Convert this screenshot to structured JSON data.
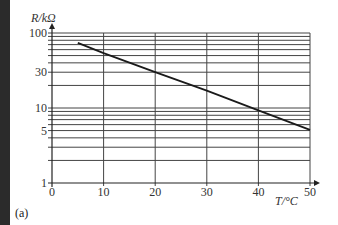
{
  "chart_data": {
    "type": "line",
    "title": "",
    "panel_label": "(a)",
    "xlabel": "T/°C",
    "ylabel": "R/kΩ",
    "yscale": "log",
    "xlim": [
      0,
      50
    ],
    "ylim": [
      1,
      100
    ],
    "x_ticks": [
      0,
      10,
      20,
      30,
      40,
      50
    ],
    "x_tick_labels": [
      "0",
      "10",
      "20",
      "30",
      "40",
      "50"
    ],
    "y_tick_labels": [
      {
        "value": 100,
        "label": "100"
      },
      {
        "value": 30,
        "label": "30"
      },
      {
        "value": 10,
        "label": "10"
      },
      {
        "value": 5,
        "label": "5"
      },
      {
        "value": 1,
        "label": "1"
      }
    ],
    "y_gridlines": [
      1,
      2,
      3,
      4,
      5,
      6,
      7,
      8,
      9,
      10,
      20,
      30,
      40,
      50,
      60,
      70,
      80,
      90,
      100
    ],
    "x_gridlines": [
      10,
      20,
      30,
      40,
      50
    ],
    "grid": true,
    "legend": null,
    "series": [
      {
        "name": "R vs T",
        "x": [
          5,
          10,
          20,
          30,
          40,
          50
        ],
        "values": [
          74,
          54,
          30,
          17,
          9.3,
          5.1
        ]
      }
    ]
  },
  "colors": {
    "line": "#1a1a1a",
    "grid": "#444444",
    "strip": "#2b2b2b"
  }
}
